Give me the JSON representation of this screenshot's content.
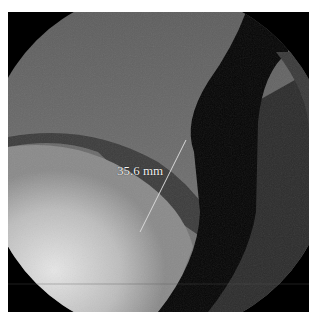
{
  "image": {
    "type": "fluoroscopy-esophagram",
    "background": "#ffffff",
    "field_color": "#000000"
  },
  "measurement": {
    "label": "35.6 mm",
    "line_color": "#d8d8d8",
    "start": [
      186,
      140
    ],
    "end": [
      140,
      232
    ]
  }
}
